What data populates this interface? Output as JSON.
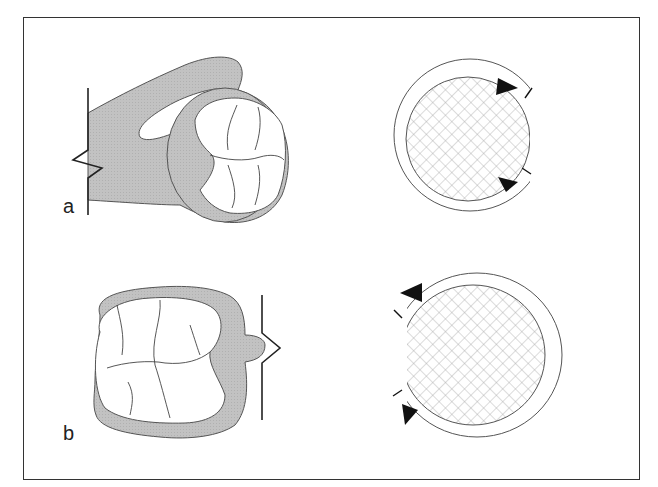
{
  "figure": {
    "panels": [
      {
        "label": "a",
        "description": "Tooth with gingival/tissue collar viewed occlusally, attached on left"
      },
      {
        "label": "b",
        "description": "Tooth with tissue collar viewed occlusally, attached on right"
      }
    ],
    "colors": {
      "tissue_fill": "#bdbdbd",
      "outline": "#555555",
      "crosshatch": "#9a9a9a",
      "arrow": "#111111",
      "frame": "#333333"
    }
  }
}
